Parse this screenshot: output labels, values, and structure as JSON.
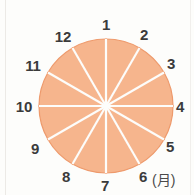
{
  "figure": {
    "unit_label": "(月)",
    "background_color": "#fdfdfb"
  },
  "chart_data": {
    "type": "pie",
    "title": "",
    "subtitle": "",
    "xlabel": "",
    "ylabel": "",
    "unit_label": "(月)",
    "legend": [],
    "legend_position": "none",
    "grid": false,
    "note": "Twelve equal sectors of 30 degrees each, labelled 1 through 12 clockwise beginning at the top (12 o'clock position). Represents the twelve months of the year.",
    "slice_fill_color": "#f6b58d",
    "slice_edge_color": "#ee9a6c",
    "divider_color": "#fdfdfb",
    "label_color": "#3b3b3b",
    "start_angle_deg": 90,
    "direction": "clockwise",
    "categories": [
      "1",
      "2",
      "3",
      "4",
      "5",
      "6",
      "7",
      "8",
      "9",
      "10",
      "11",
      "12"
    ],
    "values": [
      1,
      1,
      1,
      1,
      1,
      1,
      1,
      1,
      1,
      1,
      1,
      1
    ],
    "percentages": [
      8.33,
      8.33,
      8.33,
      8.33,
      8.33,
      8.33,
      8.33,
      8.33,
      8.33,
      8.33,
      8.33,
      8.33
    ],
    "slices": [
      {
        "label": "1",
        "value": 1,
        "percent": 8.33,
        "start_deg": 0,
        "end_deg": 30,
        "label_x": 106,
        "label_y": 24
      },
      {
        "label": "2",
        "value": 1,
        "percent": 8.33,
        "start_deg": 30,
        "end_deg": 60,
        "label_x": 144,
        "label_y": 34
      },
      {
        "label": "3",
        "value": 1,
        "percent": 8.33,
        "start_deg": 60,
        "end_deg": 90,
        "label_x": 171,
        "label_y": 63
      },
      {
        "label": "4",
        "value": 1,
        "percent": 8.33,
        "start_deg": 90,
        "end_deg": 120,
        "label_x": 180,
        "label_y": 106
      },
      {
        "label": "5",
        "value": 1,
        "percent": 8.33,
        "start_deg": 120,
        "end_deg": 150,
        "label_x": 170,
        "label_y": 146
      },
      {
        "label": "6",
        "value": 1,
        "percent": 8.33,
        "start_deg": 150,
        "end_deg": 180,
        "label_x": 143,
        "label_y": 176
      },
      {
        "label": "7",
        "value": 1,
        "percent": 8.33,
        "start_deg": 180,
        "end_deg": 210,
        "label_x": 105,
        "label_y": 185
      },
      {
        "label": "8",
        "value": 1,
        "percent": 8.33,
        "start_deg": 210,
        "end_deg": 240,
        "label_x": 66,
        "label_y": 176
      },
      {
        "label": "9",
        "value": 1,
        "percent": 8.33,
        "start_deg": 240,
        "end_deg": 270,
        "label_x": 35,
        "label_y": 148
      },
      {
        "label": "10",
        "value": 1,
        "percent": 8.33,
        "start_deg": 270,
        "end_deg": 300,
        "label_x": 24,
        "label_y": 106
      },
      {
        "label": "11",
        "value": 1,
        "percent": 8.33,
        "start_deg": 300,
        "end_deg": 330,
        "label_x": 33,
        "label_y": 65
      },
      {
        "label": "12",
        "value": 1,
        "percent": 8.33,
        "start_deg": 330,
        "end_deg": 360,
        "label_x": 63,
        "label_y": 36
      }
    ],
    "geometry": {
      "center_x": 106,
      "center_y": 106,
      "radius": 67
    }
  }
}
